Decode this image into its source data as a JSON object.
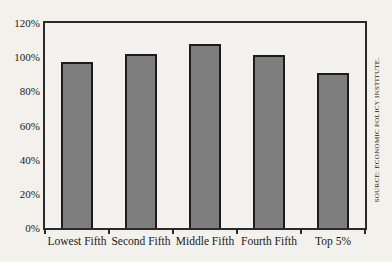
{
  "colors": {
    "background": "#f2f1ec",
    "plot_background": "#f3f2ee",
    "frame": "#2a2a2a",
    "bar_fill": "#7e7e7e",
    "bar_border": "#1c1c1c",
    "text": "#1a1a1a"
  },
  "chart_data": {
    "type": "bar",
    "categories": [
      "Lowest Fifth",
      "Second Fifth",
      "Middle Fifth",
      "Fourth Fifth",
      "Top 5%"
    ],
    "values": [
      97,
      102,
      108,
      101,
      91
    ],
    "title": "",
    "xlabel": "",
    "ylabel": "",
    "ylim": [
      0,
      120
    ],
    "y_tick_values": [
      0,
      20,
      40,
      60,
      80,
      100,
      120
    ],
    "y_tick_labels": [
      "0%",
      "20%",
      "40%",
      "60%",
      "80%",
      "100%",
      "120%"
    ],
    "grid": false,
    "legend": "none",
    "source": "SOURCE: ECONOMIC POLICY INSTITUTE."
  }
}
